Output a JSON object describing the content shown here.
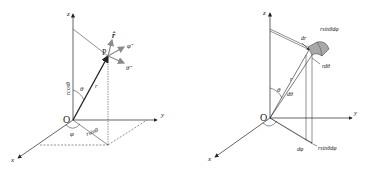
{
  "left_diagram": {
    "axes": {
      "x": "x",
      "y": "y",
      "z": "z"
    },
    "origin": "O",
    "point": "P",
    "radius": "r",
    "polar_angle": "θ",
    "azimuth": "φ",
    "z_projection": "rcosθ",
    "xy_projection": "rsinθ",
    "unit_vectors": {
      "r": "r̂",
      "theta": "θ̂",
      "phi": "φ̂"
    }
  },
  "right_diagram": {
    "axes": {
      "x": "x",
      "y": "y",
      "z": "z"
    },
    "origin": "O",
    "radius": "r",
    "polar_angle": "θ",
    "d_theta": "dθ",
    "d_phi": "dφ",
    "dr": "dr",
    "r_dtheta": "rdθ",
    "arc_top": "rsinθdφ",
    "arc_bottom": "rsinθdφ"
  },
  "colors": {
    "ink": "#222222",
    "vector_gray": "#8a8a8a",
    "volume_fill": "#a8a8a8"
  },
  "caption": ""
}
